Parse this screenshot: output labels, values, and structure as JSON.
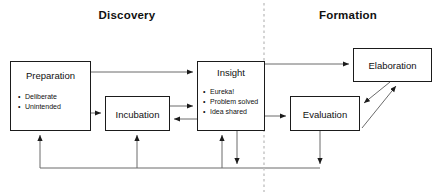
{
  "diagram": {
    "title_visible": false,
    "colors": {
      "background": "#ffffff",
      "node_border": "#1b1b1b",
      "node_fill": "#ffffff",
      "text": "#111111",
      "connector": "#555555",
      "divider": "#bdbdbd"
    },
    "headings": [
      {
        "id": "discovery",
        "label": "Discovery"
      },
      {
        "id": "formation",
        "label": "Formation"
      }
    ],
    "divider": {
      "orientation": "vertical",
      "style": "dashed",
      "x": 264
    },
    "nodes": [
      {
        "id": "preparation",
        "title": "Preparation",
        "bullets": [
          "Deliberate",
          "Unintended"
        ],
        "phase": "Discovery"
      },
      {
        "id": "incubation",
        "title": "Incubation",
        "bullets": [],
        "phase": "Discovery"
      },
      {
        "id": "insight",
        "title": "Insight",
        "bullets": [
          "Eureka!",
          "Problem solved",
          "Idea shared"
        ],
        "phase": "Discovery"
      },
      {
        "id": "evaluation",
        "title": "Evaluation",
        "bullets": [],
        "phase": "Formation"
      },
      {
        "id": "elaboration",
        "title": "Elaboration",
        "bullets": [],
        "phase": "Formation"
      }
    ],
    "edges": [
      {
        "from": "preparation",
        "to": "insight",
        "label": "",
        "style": "solid",
        "arrow": "single"
      },
      {
        "from": "preparation",
        "to": "incubation",
        "label": "",
        "style": "solid",
        "arrow": "single"
      },
      {
        "from": "incubation",
        "to": "insight",
        "label": "",
        "style": "solid",
        "arrow": "single"
      },
      {
        "from": "insight",
        "to": "incubation",
        "label": "",
        "style": "solid",
        "arrow": "single"
      },
      {
        "from": "insight",
        "to": "elaboration",
        "label": "",
        "style": "solid",
        "arrow": "single"
      },
      {
        "from": "insight",
        "to": "evaluation",
        "label": "",
        "style": "solid",
        "arrow": "single"
      },
      {
        "from": "elaboration",
        "to": "evaluation",
        "label": "",
        "style": "solid",
        "arrow": "single"
      },
      {
        "from": "evaluation",
        "to": "elaboration",
        "label": "",
        "style": "solid",
        "arrow": "single"
      },
      {
        "from": "insight",
        "to": "feedback-bus",
        "label": "",
        "style": "solid",
        "arrow": "single"
      },
      {
        "from": "evaluation",
        "to": "feedback-bus",
        "label": "",
        "style": "solid",
        "arrow": "single"
      },
      {
        "from": "feedback-bus",
        "to": "preparation",
        "label": "",
        "style": "solid",
        "arrow": "single"
      },
      {
        "from": "feedback-bus",
        "to": "incubation",
        "label": "",
        "style": "solid",
        "arrow": "single"
      },
      {
        "from": "feedback-bus",
        "to": "insight",
        "label": "",
        "style": "solid",
        "arrow": "single"
      }
    ]
  }
}
